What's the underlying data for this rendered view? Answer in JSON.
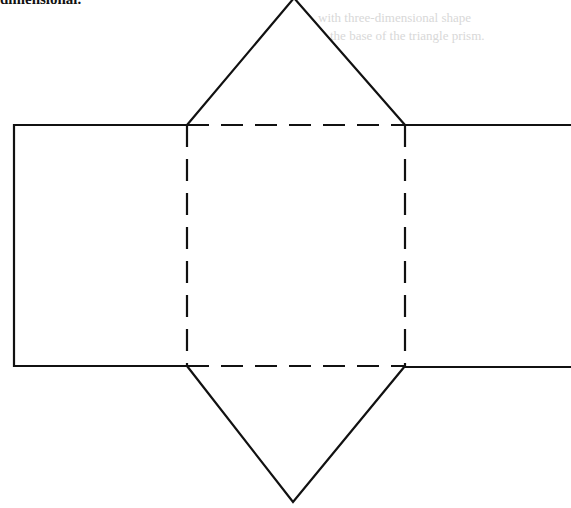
{
  "caption": {
    "text": "dimensional."
  },
  "ghost_text": [
    {
      "text": "with three-dimensional shape"
    },
    {
      "text": "the base of the triangle prism."
    }
  ],
  "diagram": {
    "type": "net-of-triangular-prism",
    "stroke_color": "#111111",
    "background": "#ffffff",
    "faces": [
      {
        "name": "top-triangle",
        "points": "187,125 294,-2 405,125"
      },
      {
        "name": "bottom-triangle",
        "points": "187,366 293,502 405,366"
      },
      {
        "name": "left-rectangle",
        "x": 14,
        "y": 125,
        "w": 173,
        "h": 241
      },
      {
        "name": "center-square",
        "x": 187,
        "y": 125,
        "w": 218,
        "h": 241,
        "dashed": true
      },
      {
        "name": "right-rectangle",
        "x": 405,
        "y": 125,
        "w": 170,
        "h": 241
      }
    ]
  }
}
